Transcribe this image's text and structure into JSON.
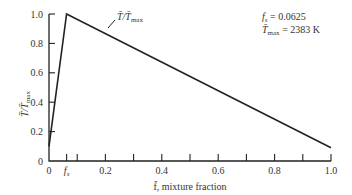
{
  "chart_data": {
    "type": "line",
    "title": "",
    "xlabel": "f̄, mixture fraction",
    "ylabel": "T̄/T̄max",
    "xlim": [
      0,
      1.0
    ],
    "ylim": [
      0,
      1.0
    ],
    "grid": false,
    "x_ticks": [
      0,
      0.0625,
      0.1,
      0.2,
      0.3,
      0.4,
      0.5,
      0.6,
      0.7,
      0.8,
      0.9,
      1.0
    ],
    "x_tick_labels": [
      "0",
      "f_s",
      "0.2",
      "0.4",
      "0.6",
      "0.8",
      "1.0"
    ],
    "y_ticks": [
      0,
      0.2,
      0.4,
      0.6,
      0.8,
      1.0
    ],
    "y_tick_labels": [
      "0",
      "0.2",
      "0.4",
      "0.6",
      "0.8",
      "1.0"
    ],
    "series": [
      {
        "name": "T̄/T̄max",
        "x": [
          0,
          0.0625,
          1.0
        ],
        "y": [
          0.1,
          1.0,
          0.09
        ]
      }
    ],
    "annotations": [
      {
        "text": "T̄/T̄max",
        "target": "curve label near peak"
      },
      {
        "text": "f_s = 0.0625"
      },
      {
        "text": "T̄max = 2383 K"
      }
    ]
  },
  "labels": {
    "curve": "T̄/T̄",
    "curve_sub": "max",
    "fs_label": "f",
    "fs_sub": "s",
    "fs_value": " = 0.0625",
    "tmax_label": "T̄",
    "tmax_sub": "max",
    "tmax_value": " = 2383 K",
    "xaxis": "f̄, mixture fraction",
    "yaxis": "T̄/T̄",
    "yaxis_sub": "max"
  }
}
